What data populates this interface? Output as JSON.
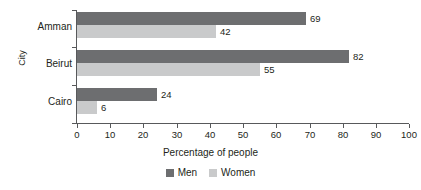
{
  "chart_data": {
    "type": "bar",
    "orientation": "horizontal",
    "title": "",
    "categories": [
      "Amman",
      "Beirut",
      "Cairo"
    ],
    "series": [
      {
        "name": "Men",
        "values": [
          69,
          82,
          24
        ],
        "color": "#6d6e70"
      },
      {
        "name": "Women",
        "values": [
          42,
          55,
          6
        ],
        "color": "#c9cacb"
      }
    ],
    "xlabel": "Percentage of people",
    "ylabel": "City",
    "xlim": [
      0,
      100
    ],
    "xticks": [
      0,
      10,
      20,
      30,
      40,
      50,
      60,
      70,
      80,
      90,
      100
    ],
    "xtick_labels": [
      "0",
      "10",
      "20",
      "30",
      "40",
      "50",
      "60",
      "70",
      "80",
      "90",
      "100"
    ],
    "grid": false,
    "legend_position": "bottom",
    "data_labels": true,
    "data_label_values": [
      "69",
      "42",
      "82",
      "55",
      "24",
      "6"
    ],
    "axis_color": "#58595b",
    "text_color": "#231f20",
    "background": "#ffffff"
  }
}
